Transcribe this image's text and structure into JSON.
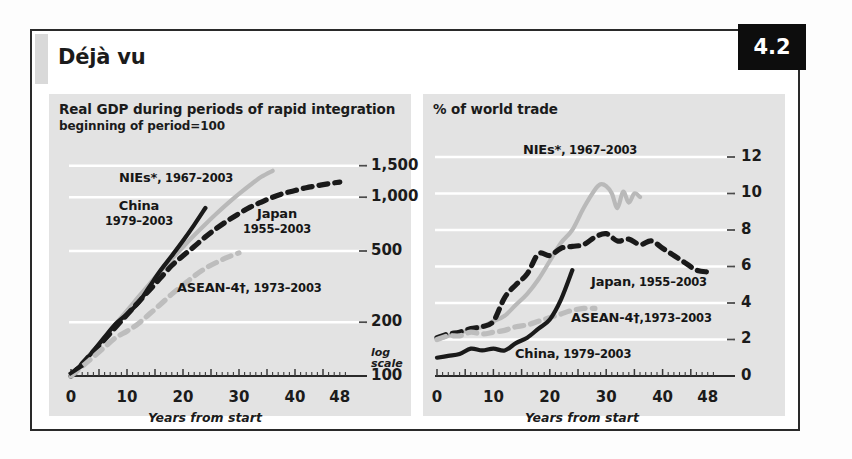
{
  "figure": {
    "title": "Déjà vu",
    "badge": "4.2"
  },
  "chart_data": [
    {
      "id": "left",
      "type": "line",
      "title": "Real GDP during periods of rapid integration",
      "subtitle": "beginning of period=100",
      "xlabel": "Years from start",
      "ylabel": "",
      "scale_note_line1": "log",
      "scale_note_line2": "scale",
      "yscale": "log",
      "ylim": [
        100,
        1700
      ],
      "yticks": [
        100,
        200,
        500,
        1000,
        1500
      ],
      "ytick_labels": [
        "100",
        "200",
        "500",
        "1,000",
        "1,500"
      ],
      "xlim": [
        0,
        50
      ],
      "xticks": [
        0,
        10,
        20,
        30,
        40,
        48
      ],
      "xtick_labels": [
        "0",
        "10",
        "20",
        "30",
        "40",
        "48"
      ],
      "grid": "horizontal-white",
      "series": [
        {
          "name": "NIEs*, 1967-2003",
          "label": "NIEs*",
          "years": "1967–2003",
          "color": "#b9b9b9",
          "style": "solid",
          "x": [
            0,
            2,
            4,
            6,
            8,
            10,
            12,
            14,
            16,
            18,
            20,
            22,
            24,
            26,
            28,
            30,
            32,
            34,
            36
          ],
          "y": [
            100,
            118,
            139,
            165,
            196,
            232,
            276,
            327,
            385,
            452,
            527,
            612,
            706,
            810,
            923,
            1043,
            1170,
            1300,
            1405
          ]
        },
        {
          "name": "China, 1979-2003",
          "label": "China",
          "years": "1979–2003",
          "color": "#1a1a1a",
          "style": "solid",
          "x": [
            0,
            2,
            4,
            6,
            8,
            10,
            12,
            14,
            16,
            18,
            20,
            22,
            24
          ],
          "y": [
            100,
            117,
            138,
            165,
            196,
            222,
            256,
            316,
            390,
            470,
            570,
            700,
            870
          ]
        },
        {
          "name": "Japan, 1955-2003",
          "label": "Japan",
          "years": "1955–2003",
          "color": "#1a1a1a",
          "style": "dashed",
          "x": [
            0,
            2,
            4,
            6,
            8,
            10,
            12,
            14,
            16,
            18,
            20,
            22,
            24,
            26,
            28,
            30,
            32,
            34,
            36,
            38,
            40,
            42,
            44,
            46,
            48
          ],
          "y": [
            100,
            117,
            137,
            160,
            188,
            220,
            258,
            302,
            354,
            415,
            470,
            530,
            600,
            670,
            740,
            810,
            880,
            940,
            1000,
            1050,
            1090,
            1130,
            1160,
            1190,
            1215
          ]
        },
        {
          "name": "ASEAN-4†, 1973-2003",
          "label": "ASEAN-4†",
          "years": "1973–2003",
          "color": "#bdbdbd",
          "style": "dashed",
          "x": [
            0,
            2,
            4,
            6,
            8,
            10,
            12,
            14,
            16,
            18,
            20,
            22,
            24,
            26,
            28,
            30
          ],
          "y": [
            100,
            113,
            128,
            145,
            164,
            178,
            196,
            222,
            252,
            287,
            322,
            362,
            400,
            432,
            462,
            488
          ]
        }
      ]
    },
    {
      "id": "right",
      "type": "line",
      "title": "% of world trade",
      "subtitle": "",
      "xlabel": "Years from start",
      "ylabel": "",
      "yscale": "linear",
      "ylim": [
        0,
        12.6
      ],
      "yticks": [
        0,
        2,
        4,
        6,
        8,
        10,
        12
      ],
      "ytick_labels": [
        "0",
        "2",
        "4",
        "6",
        "8",
        "10",
        "12"
      ],
      "xlim": [
        0,
        50
      ],
      "xticks": [
        0,
        10,
        20,
        30,
        40,
        48
      ],
      "xtick_labels": [
        "0",
        "10",
        "20",
        "30",
        "40",
        "48"
      ],
      "grid": "horizontal-white",
      "series": [
        {
          "name": "NIEs*, 1967-2003",
          "label": "NIEs*",
          "years": "1967–2003",
          "color": "#b9b9b9",
          "style": "solid",
          "x": [
            0,
            2,
            4,
            6,
            8,
            10,
            12,
            14,
            16,
            18,
            20,
            22,
            24,
            26,
            28,
            29,
            30,
            31,
            32,
            33,
            34,
            35,
            36
          ],
          "y": [
            2.0,
            2.2,
            2.4,
            2.5,
            2.7,
            3.0,
            3.3,
            3.9,
            4.5,
            5.3,
            6.3,
            7.3,
            8.0,
            9.2,
            10.2,
            10.5,
            10.4,
            10.0,
            9.2,
            10.1,
            9.5,
            10.0,
            9.8
          ]
        },
        {
          "name": "Japan, 1955-2003",
          "label": "Japan",
          "years": "1955–2003",
          "color": "#1a1a1a",
          "style": "dashed",
          "x": [
            0,
            2,
            4,
            6,
            8,
            10,
            12,
            14,
            16,
            18,
            20,
            22,
            24,
            26,
            28,
            30,
            32,
            34,
            36,
            38,
            40,
            42,
            44,
            46,
            48
          ],
          "y": [
            2.1,
            2.3,
            2.4,
            2.6,
            2.7,
            3.0,
            4.3,
            5.0,
            5.6,
            6.7,
            6.6,
            7.0,
            7.1,
            7.2,
            7.6,
            7.8,
            7.4,
            7.5,
            7.2,
            7.4,
            7.0,
            6.6,
            6.2,
            5.8,
            5.7
          ]
        },
        {
          "name": "ASEAN-4†,1973-2003",
          "label": "ASEAN-4†",
          "years": "1973–2003",
          "color": "#bdbdbd",
          "style": "dashed",
          "x": [
            0,
            2,
            4,
            6,
            8,
            10,
            12,
            14,
            16,
            18,
            20,
            22,
            24,
            26,
            28
          ],
          "y": [
            2.0,
            2.2,
            2.2,
            2.4,
            2.3,
            2.4,
            2.5,
            2.7,
            2.8,
            3.0,
            3.2,
            3.4,
            3.6,
            3.7,
            3.7
          ]
        },
        {
          "name": "China, 1979-2003",
          "label": "China",
          "years": "1979–2003",
          "color": "#1a1a1a",
          "style": "solid",
          "x": [
            0,
            2,
            4,
            6,
            8,
            10,
            12,
            14,
            16,
            18,
            20,
            22,
            24
          ],
          "y": [
            1.0,
            1.1,
            1.2,
            1.5,
            1.4,
            1.5,
            1.4,
            1.8,
            2.1,
            2.6,
            3.1,
            4.2,
            5.8
          ]
        }
      ]
    }
  ]
}
